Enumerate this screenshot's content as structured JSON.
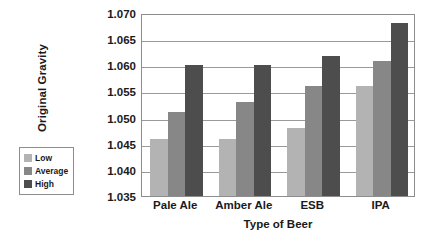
{
  "chart_data": {
    "type": "bar",
    "title": "",
    "xlabel": "Type of Beer",
    "ylabel": "Original Gravity",
    "categories": [
      "Pale Ale",
      "Amber Ale",
      "ESB",
      "IPA"
    ],
    "series": [
      {
        "name": "Low",
        "color": "#b3b3b3",
        "values": [
          1.046,
          1.046,
          1.048,
          1.056
        ]
      },
      {
        "name": "Average",
        "color": "#878787",
        "values": [
          1.051,
          1.053,
          1.056,
          1.0608
        ]
      },
      {
        "name": "High",
        "color": "#4d4d4d",
        "values": [
          1.06,
          1.06,
          1.0617,
          1.068
        ]
      }
    ],
    "ylim": [
      1.035,
      1.07
    ],
    "ytick_step": 0.005,
    "yticks": [
      "1.035",
      "1.040",
      "1.045",
      "1.050",
      "1.055",
      "1.060",
      "1.065",
      "1.070"
    ],
    "ytick_values": [
      1.035,
      1.04,
      1.045,
      1.05,
      1.055,
      1.06,
      1.065,
      1.07
    ],
    "grid": true,
    "grid_axis": "y",
    "legend_position": "outside-left",
    "legend_entries": [
      "Low",
      "Average",
      "High"
    ],
    "plot_background": "#ffffff",
    "grid_color": "#9a9a9a",
    "frame_color": "#8d8d8d"
  }
}
